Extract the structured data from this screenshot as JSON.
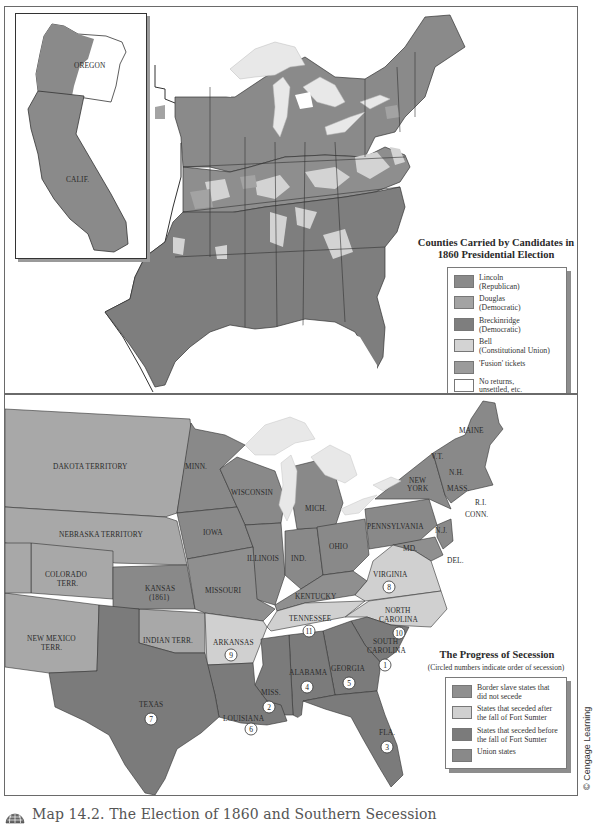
{
  "colors": {
    "lincoln": "#8a8a8a",
    "douglas": "#a3a3a3",
    "breckinridge": "#7e7e7e",
    "bell": "#d3d3d3",
    "fusion": "#9b9b9b",
    "no_returns": "#ffffff",
    "border_slave": "#8f8f8f",
    "seceded_after": "#d0d0d0",
    "seceded_before": "#7b7b7b",
    "union": "#898989",
    "territory": "#a8a8a8",
    "lakes": "#e8e8e8",
    "border_line": "#333333"
  },
  "top_map": {
    "inset_labels": {
      "oregon": "OREGON",
      "calif": "CALIF."
    },
    "legend": {
      "title_line1": "Counties Carried by Candidates in",
      "title_line2": "1860 Presidential Election",
      "items": [
        {
          "label_line1": "Lincoln",
          "label_line2": "(Republican)",
          "color_key": "lincoln"
        },
        {
          "label_line1": "Douglas",
          "label_line2": "(Democratic)",
          "color_key": "douglas"
        },
        {
          "label_line1": "Breckinridge",
          "label_line2": "(Democratic)",
          "color_key": "breckinridge"
        },
        {
          "label_line1": "Bell",
          "label_line2": "(Constitutional Union)",
          "color_key": "bell"
        },
        {
          "label_line1": "'Fusion' tickets",
          "label_line2": "",
          "color_key": "fusion"
        },
        {
          "label_line1": "No returns,",
          "label_line2": "unsettled, etc.",
          "color_key": "no_returns"
        }
      ]
    }
  },
  "bottom_map": {
    "labels": {
      "dakota": "DAKOTA TERRITORY",
      "nebraska": "NEBRASKA TERRITORY",
      "colorado_1": "COLORADO",
      "colorado_2": "TERR.",
      "kansas_1": "KANSAS",
      "kansas_2": "(1861)",
      "new_mexico_1": "NEW MEXICO",
      "new_mexico_2": "TERR.",
      "indian": "INDIAN TERR.",
      "texas": "TEXAS",
      "minn": "MINN.",
      "wisconsin": "WISCONSIN",
      "iowa": "IOWA",
      "illinois": "ILLINOIS",
      "missouri": "MISSOURI",
      "arkansas": "ARKANSAS",
      "louisiana": "LOUISIANA",
      "miss": "MISS.",
      "alabama": "ALABAMA",
      "georgia": "GEORGIA",
      "fla": "FLA.",
      "south_carolina_1": "SOUTH",
      "south_carolina_2": "CAROLINA",
      "north_carolina_1": "NORTH",
      "north_carolina_2": "CAROLINA",
      "tennessee": "TENNESSEE",
      "kentucky": "KENTUCKY",
      "virginia": "VIRGINIA",
      "mich": "MICH.",
      "ind": "IND.",
      "ohio": "OHIO",
      "pennsylvania": "PENNSYLVANIA",
      "new_york_1": "NEW",
      "new_york_2": "YORK",
      "md": "MD.",
      "del": "DEL.",
      "nj": "N.J.",
      "conn": "CONN.",
      "ri": "R.I.",
      "mass": "MASS.",
      "nh": "N.H.",
      "vt": "V.T.",
      "maine": "MAINE"
    },
    "secession_order": {
      "south_carolina": "1",
      "miss": "2",
      "fla": "3",
      "alabama": "4",
      "georgia": "5",
      "louisiana": "6",
      "texas": "7",
      "virginia": "8",
      "arkansas": "9",
      "north_carolina": "10",
      "tennessee": "11"
    },
    "legend": {
      "title": "The Progress of Secession",
      "subtitle": "(Circled numbers indicate order of secession)",
      "items": [
        {
          "label_line1": "Border slave states that",
          "label_line2": "did not secede",
          "color_key": "border_slave"
        },
        {
          "label_line1": "States that seceded after",
          "label_line2": "the fall of Fort Sumter",
          "color_key": "seceded_after"
        },
        {
          "label_line1": "States that seceded before",
          "label_line2": "the fall of Fort Sumter",
          "color_key": "seceded_before"
        },
        {
          "label_line1": "Union states",
          "label_line2": "",
          "color_key": "union"
        }
      ]
    }
  },
  "caption": {
    "icon": "globe-icon",
    "text": "Map 14.2. The Election of 1860 and Southern Secession"
  },
  "credit": "© Cengage Learning"
}
